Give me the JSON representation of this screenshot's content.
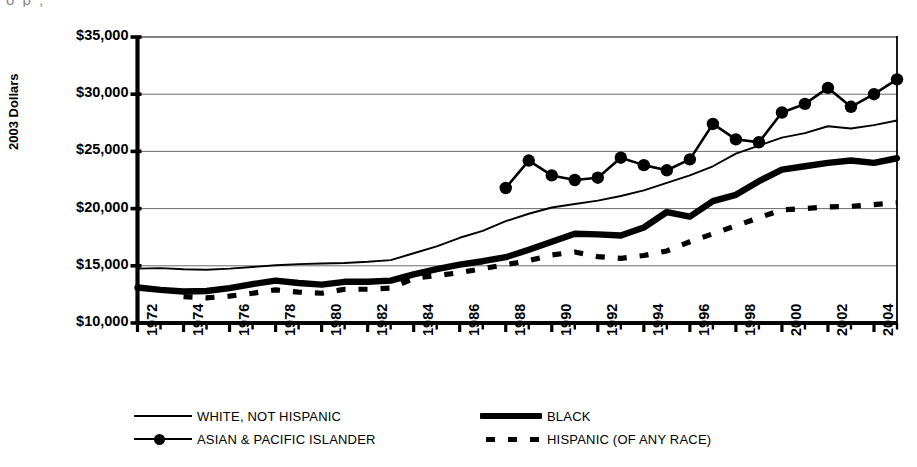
{
  "top_artifact": "o        p   ,",
  "axis": {
    "ylabel": "2003 Dollars",
    "yticks": [
      "$10,000",
      "$15,000",
      "$20,000",
      "$25,000",
      "$30,000",
      "$35,000"
    ],
    "xticks": [
      "1972",
      "1974",
      "1976",
      "1978",
      "1980",
      "1982",
      "1984",
      "1986",
      "1988",
      "1990",
      "1992",
      "1994",
      "1996",
      "1998",
      "2000",
      "2002",
      "2004"
    ]
  },
  "legend": {
    "items": [
      {
        "label": "WHITE, NOT HISPANIC",
        "style": "thin-line"
      },
      {
        "label": "BLACK",
        "style": "thick-line"
      },
      {
        "label": "ASIAN & PACIFIC ISLANDER",
        "style": "line-marker"
      },
      {
        "label": "HISPANIC (OF ANY RACE)",
        "style": "dashed-line"
      }
    ]
  },
  "chart_data": {
    "type": "line",
    "title": "",
    "xlabel": "",
    "ylabel": "2003 Dollars",
    "xlim": [
      1972,
      2005
    ],
    "ylim": [
      10000,
      35000
    ],
    "grid": true,
    "legend_position": "bottom",
    "x": [
      1972,
      1973,
      1974,
      1975,
      1976,
      1977,
      1978,
      1979,
      1980,
      1981,
      1982,
      1983,
      1984,
      1985,
      1986,
      1987,
      1988,
      1989,
      1990,
      1991,
      1992,
      1993,
      1994,
      1995,
      1996,
      1997,
      1998,
      1999,
      2000,
      2001,
      2002,
      2003,
      2004,
      2005
    ],
    "series": [
      {
        "name": "WHITE, NOT HISPANIC",
        "style": "thin-line",
        "values": [
          14750,
          14800,
          14700,
          14650,
          14750,
          14900,
          15050,
          15150,
          15200,
          15250,
          15350,
          15500,
          16100,
          16700,
          17450,
          18050,
          18900,
          19550,
          20100,
          20400,
          20700,
          21100,
          21600,
          22250,
          22900,
          23700,
          24800,
          25500,
          26200,
          26600,
          27200,
          27000,
          27300,
          27700
        ]
      },
      {
        "name": "BLACK",
        "style": "thick-line",
        "values": [
          13100,
          12900,
          12750,
          12800,
          13050,
          13400,
          13700,
          13500,
          13350,
          13600,
          13600,
          13700,
          14250,
          14700,
          15100,
          15400,
          15750,
          16400,
          17100,
          17800,
          17750,
          17650,
          18350,
          19700,
          19300,
          20650,
          21200,
          22400,
          23400,
          23700,
          24000,
          24200,
          24000,
          24400
        ]
      },
      {
        "name": "ASIAN & PACIFIC ISLANDER",
        "style": "line-marker",
        "values": [
          null,
          null,
          null,
          null,
          null,
          null,
          null,
          null,
          null,
          null,
          null,
          null,
          null,
          null,
          null,
          null,
          21800,
          24200,
          22900,
          22500,
          22700,
          24450,
          23800,
          23350,
          24300,
          27400,
          26050,
          25800,
          28400,
          29150,
          30550,
          28900,
          30000,
          31300
        ]
      },
      {
        "name": "HISPANIC (OF ANY RACE)",
        "style": "dashed-line",
        "values": [
          null,
          null,
          12300,
          12200,
          12350,
          12600,
          12900,
          12700,
          12600,
          12950,
          12950,
          13050,
          13900,
          14150,
          14400,
          14750,
          15100,
          15450,
          15950,
          16200,
          15800,
          15650,
          15900,
          16300,
          17100,
          17800,
          18500,
          19200,
          19900,
          20000,
          20150,
          20200,
          20350,
          20500
        ]
      }
    ]
  }
}
